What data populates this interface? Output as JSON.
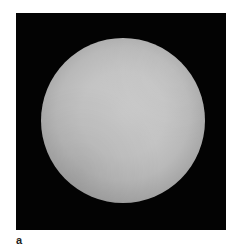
{
  "figure": {
    "panel_label": "a",
    "panel_background": "#030303",
    "sphere_color": "#c4c4c4"
  }
}
